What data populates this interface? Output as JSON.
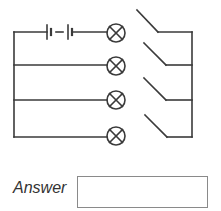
{
  "diagram": {
    "type": "circuit",
    "components": {
      "battery": {
        "cells": 2
      },
      "lamps": 4,
      "switches": 4,
      "switch_state": "open"
    },
    "colors": {
      "wire": "#3a3a3a",
      "box_border": "#8a8a8a"
    }
  },
  "answer": {
    "label": "Answer",
    "value": ""
  }
}
